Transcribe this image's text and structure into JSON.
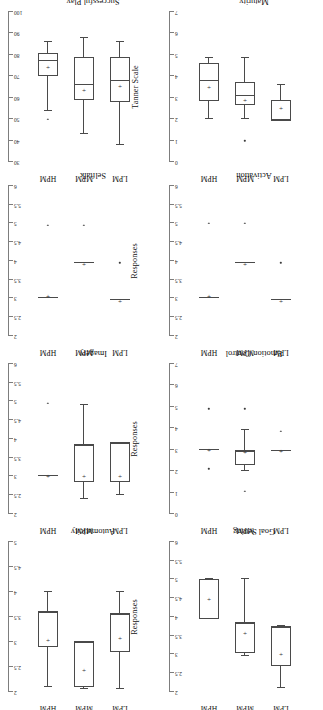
{
  "figure": {
    "group_labels": [
      "LPM",
      "MPM",
      "HPM"
    ],
    "orientation_note": "rotated-180"
  },
  "chart_data": [
    {
      "type": "box",
      "title": "Goal Setting",
      "ylabel": "Responses",
      "xlabel": "",
      "categories": [
        "LPM",
        "MPM",
        "HPM"
      ],
      "ylim": [
        2,
        6
      ],
      "yticks": [
        "2",
        "2.5",
        "3",
        "3.5",
        "4",
        "4.5",
        "5",
        "5.5",
        "6"
      ],
      "grid": false,
      "inverted_y": true,
      "boxes": [
        {
          "name": "LPM",
          "whisker_low": 2.1,
          "q1": 2.7,
          "median": 3.7,
          "q3": 3.75,
          "whisker_high": 3.75,
          "mean": 3.05,
          "outliers": []
        },
        {
          "name": "MPM",
          "whisker_low": 2.95,
          "q1": 3.05,
          "median": 3.85,
          "q3": 3.85,
          "whisker_high": 5.0,
          "mean": 3.6,
          "outliers": []
        },
        {
          "name": "HPM",
          "whisker_low": 3.95,
          "q1": 3.95,
          "median": 3.95,
          "q3": 5.0,
          "whisker_high": 5.0,
          "mean": 4.5,
          "outliers": []
        }
      ]
    },
    {
      "type": "box",
      "title": "Automaticity",
      "ylabel": "Responses",
      "xlabel": "",
      "categories": [
        "LPM",
        "MPM",
        "HPM"
      ],
      "ylim": [
        2,
        5
      ],
      "yticks": [
        "2",
        "2.5",
        "3",
        "3.5",
        "4",
        "4.5",
        "5"
      ],
      "grid": false,
      "inverted_y": true,
      "boxes": [
        {
          "name": "LPM",
          "whisker_low": 2.05,
          "q1": 2.8,
          "median": 3.55,
          "q3": 3.55,
          "whisker_high": 4.0,
          "mean": 3.1,
          "outliers": []
        },
        {
          "name": "MPM",
          "whisker_low": 2.05,
          "q1": 2.1,
          "median": 3.0,
          "q3": 3.0,
          "whisker_high": 3.0,
          "mean": 2.45,
          "outliers": []
        },
        {
          "name": "HPM",
          "whisker_low": 2.1,
          "q1": 2.9,
          "median": 3.6,
          "q3": 3.6,
          "whisker_high": 4.0,
          "mean": 3.05,
          "outliers": []
        }
      ]
    },
    {
      "type": "box",
      "title": "Emotion Control",
      "ylabel": "Responses",
      "xlabel": "",
      "categories": [
        "LPM",
        "MPM",
        "HPM"
      ],
      "ylim": [
        0,
        7
      ],
      "yticks": [
        "0",
        "1",
        "2",
        "3",
        "4",
        "5",
        "6",
        "7"
      ],
      "grid": false,
      "inverted_y": true,
      "boxes": [
        {
          "name": "LPM",
          "whisker_low": 2.95,
          "q1": 2.95,
          "median": 2.95,
          "q3": 2.95,
          "whisker_high": 2.95,
          "mean": 3.0,
          "outliers": [
            3.85
          ]
        },
        {
          "name": "MPM",
          "whisker_low": 2.0,
          "q1": 2.3,
          "median": 2.9,
          "q3": 3.0,
          "whisker_high": 3.9,
          "mean": 2.95,
          "outliers": [
            1.05,
            4.9
          ]
        },
        {
          "name": "HPM",
          "whisker_low": 3.0,
          "q1": 3.0,
          "median": 3.0,
          "q3": 3.0,
          "whisker_high": 3.0,
          "mean": 3.05,
          "outliers": [
            2.1,
            4.9
          ]
        }
      ]
    },
    {
      "type": "box",
      "title": "Imagery",
      "ylabel": "Responses",
      "xlabel": "",
      "categories": [
        "LPM",
        "MPM",
        "HPM"
      ],
      "ylim": [
        2,
        6
      ],
      "yticks": [
        "2",
        "2.5",
        "3",
        "3.5",
        "4",
        "4.5",
        "5",
        "5.5",
        "6"
      ],
      "grid": false,
      "inverted_y": true,
      "boxes": [
        {
          "name": "LPM",
          "whisker_low": 2.5,
          "q1": 2.85,
          "median": 3.9,
          "q3": 3.9,
          "whisker_high": 3.9,
          "mean": 3.05,
          "outliers": []
        },
        {
          "name": "MPM",
          "whisker_low": 2.4,
          "q1": 2.85,
          "median": 3.85,
          "q3": 3.85,
          "whisker_high": 4.9,
          "mean": 3.05,
          "outliers": []
        },
        {
          "name": "HPM",
          "whisker_low": 3.0,
          "q1": 3.0,
          "median": 3.0,
          "q3": 3.0,
          "whisker_high": 3.0,
          "mean": 3.05,
          "outliers": [
            4.95
          ]
        }
      ]
    },
    {
      "type": "box",
      "title": "Activation",
      "ylabel": "Responses",
      "xlabel": "",
      "categories": [
        "LPM",
        "MPM",
        "HPM"
      ],
      "ylim": [
        2,
        6
      ],
      "yticks": [
        "2",
        "2.5",
        "3",
        "3.5",
        "4",
        "4.5",
        "5",
        "5.5",
        "6"
      ],
      "grid": false,
      "inverted_y": true,
      "boxes": [
        {
          "name": "LPM",
          "whisker_low": 2.95,
          "q1": 2.95,
          "median": 2.95,
          "q3": 2.95,
          "whisker_high": 2.95,
          "mean": 2.95,
          "outliers": [
            3.95
          ]
        },
        {
          "name": "MPM",
          "whisker_low": 3.95,
          "q1": 3.95,
          "median": 3.95,
          "q3": 3.95,
          "whisker_high": 3.95,
          "mean": 3.95,
          "outliers": [
            5.0
          ]
        },
        {
          "name": "HPM",
          "whisker_low": 3.0,
          "q1": 3.0,
          "median": 3.0,
          "q3": 3.0,
          "whisker_high": 3.0,
          "mean": 3.1,
          "outliers": [
            5.0
          ]
        }
      ]
    },
    {
      "type": "box",
      "title": "Selftalk",
      "ylabel": "Responses",
      "xlabel": "",
      "categories": [
        "LPM",
        "MPM",
        "HPM"
      ],
      "ylim": [
        2,
        6
      ],
      "yticks": [
        "2",
        "2.5",
        "3",
        "3.5",
        "4",
        "4.5",
        "5",
        "5.5",
        "6"
      ],
      "grid": false,
      "inverted_y": true,
      "boxes": [
        {
          "name": "LPM",
          "whisker_low": 2.95,
          "q1": 2.95,
          "median": 2.95,
          "q3": 2.95,
          "whisker_high": 2.95,
          "mean": 2.95,
          "outliers": [
            3.95
          ]
        },
        {
          "name": "MPM",
          "whisker_low": 3.95,
          "q1": 3.95,
          "median": 3.95,
          "q3": 3.95,
          "whisker_high": 3.95,
          "mean": 3.95,
          "outliers": [
            4.95
          ]
        },
        {
          "name": "HPM",
          "whisker_low": 3.0,
          "q1": 3.0,
          "median": 3.0,
          "q3": 3.0,
          "whisker_high": 3.0,
          "mean": 3.1,
          "outliers": [
            4.95
          ]
        }
      ]
    },
    {
      "type": "box",
      "title": "Maturity",
      "ylabel": "Tanner Scale",
      "xlabel": "",
      "categories": [
        "LPM",
        "MPM",
        "HPM"
      ],
      "ylim": [
        0,
        7
      ],
      "yticks": [
        "0",
        "1",
        "2",
        "3",
        "4",
        "5",
        "6",
        "7"
      ],
      "grid": false,
      "inverted_y": true,
      "boxes": [
        {
          "name": "LPM",
          "whisker_low": 1.9,
          "q1": 1.9,
          "median": 1.95,
          "q3": 2.9,
          "whisker_high": 3.6,
          "mean": 2.55,
          "outliers": []
        },
        {
          "name": "MPM",
          "whisker_low": 2.0,
          "q1": 2.65,
          "median": 3.1,
          "q3": 3.75,
          "whisker_high": 4.85,
          "mean": 2.95,
          "outliers": [
            1.0
          ]
        },
        {
          "name": "HPM",
          "whisker_low": 2.0,
          "q1": 2.85,
          "median": 3.8,
          "q3": 4.6,
          "whisker_high": 4.85,
          "mean": 3.55,
          "outliers": []
        }
      ]
    },
    {
      "type": "box",
      "title": "Successful Play",
      "ylabel": "Performance (%)",
      "xlabel": "",
      "categories": [
        "LPM",
        "MPM",
        "HPM"
      ],
      "ylim": [
        30,
        100
      ],
      "yticks": [
        "30",
        "40",
        "50",
        "60",
        "70",
        "80",
        "90",
        "100"
      ],
      "grid": false,
      "inverted_y": true,
      "boxes": [
        {
          "name": "LPM",
          "whisker_low": 38,
          "q1": 58,
          "median": 68,
          "q3": 79,
          "whisker_high": 86,
          "mean": 66,
          "outliers": []
        },
        {
          "name": "MPM",
          "whisker_low": 43,
          "q1": 59,
          "median": 66,
          "q3": 79,
          "whisker_high": 88,
          "mean": 64,
          "outliers": []
        },
        {
          "name": "HPM",
          "whisker_low": 54,
          "q1": 70,
          "median": 77,
          "q3": 81,
          "whisker_high": 86,
          "mean": 75,
          "outliers": [
            50
          ]
        }
      ]
    }
  ]
}
